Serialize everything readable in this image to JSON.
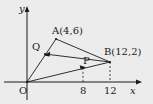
{
  "figure": {
    "type": "coordinate-geometry-diagram",
    "background_color": "#ececec",
    "ink_color": "#1a1a1a",
    "axes": {
      "x_axis_label": "x",
      "y_axis_label": "y",
      "origin_label": "O",
      "x_ticks": [
        {
          "label": "8",
          "value": 8
        },
        {
          "label": "12",
          "value": 12
        }
      ],
      "y_ticks": []
    },
    "points": [
      {
        "name": "O",
        "label": "O",
        "x": 0,
        "y": 0
      },
      {
        "name": "A",
        "label": "A(4,6)",
        "x": 4,
        "y": 6
      },
      {
        "name": "B",
        "label": "B(12,2)",
        "x": 12,
        "y": 2
      },
      {
        "name": "P",
        "label": "P",
        "x": 8,
        "y": 1.35
      },
      {
        "name": "Q",
        "label": "Q",
        "x": 2.6,
        "y": 3.9
      }
    ],
    "segments": [
      {
        "from": "O",
        "to": "A",
        "style": "solid"
      },
      {
        "from": "O",
        "to": "B",
        "style": "solid"
      },
      {
        "from": "A",
        "to": "B",
        "style": "solid"
      },
      {
        "from": "Q",
        "to": "B",
        "style": "solid"
      }
    ],
    "dashed_drops": [
      {
        "from_point": "P",
        "to_tick": "8"
      },
      {
        "from_point": "B",
        "to_tick": "12"
      }
    ],
    "arrow_markers": [
      {
        "on_segment": "A-Q",
        "at_point": "Q",
        "direction": "toward-O"
      },
      {
        "on_segment": "O-P",
        "at_point": "P",
        "direction": "toward-B"
      }
    ]
  }
}
